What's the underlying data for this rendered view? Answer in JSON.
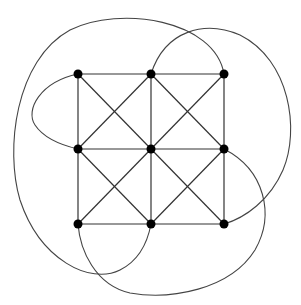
{
  "diagram": {
    "type": "graph",
    "nodes": [
      {
        "id": "n00",
        "x": 78,
        "y": 74
      },
      {
        "id": "n01",
        "x": 151,
        "y": 74
      },
      {
        "id": "n02",
        "x": 224,
        "y": 74
      },
      {
        "id": "n10",
        "x": 78,
        "y": 149
      },
      {
        "id": "n11",
        "x": 151,
        "y": 149
      },
      {
        "id": "n12",
        "x": 224,
        "y": 149
      },
      {
        "id": "n20",
        "x": 78,
        "y": 224
      },
      {
        "id": "n21",
        "x": 151,
        "y": 224
      },
      {
        "id": "n22",
        "x": 224,
        "y": 224
      }
    ],
    "straight_edges": [
      [
        "n00",
        "n01"
      ],
      [
        "n01",
        "n02"
      ],
      [
        "n10",
        "n11"
      ],
      [
        "n11",
        "n12"
      ],
      [
        "n20",
        "n21"
      ],
      [
        "n21",
        "n22"
      ],
      [
        "n00",
        "n10"
      ],
      [
        "n10",
        "n20"
      ],
      [
        "n01",
        "n11"
      ],
      [
        "n11",
        "n21"
      ],
      [
        "n02",
        "n12"
      ],
      [
        "n12",
        "n22"
      ],
      [
        "n00",
        "n11"
      ],
      [
        "n11",
        "n22"
      ],
      [
        "n01",
        "n10"
      ],
      [
        "n10",
        "n21"
      ],
      [
        "n01",
        "n12"
      ],
      [
        "n12",
        "n21"
      ],
      [
        "n02",
        "n11"
      ],
      [
        "n11",
        "n20"
      ]
    ],
    "curved_edges": [
      {
        "from": "n02",
        "to": "n21",
        "path": "M224,74 C215,20 120,5 70,30 C15,60 5,150 20,200 C40,260 90,285 120,270 C140,260 148,240 151,224"
      },
      {
        "from": "n00",
        "to": "n10",
        "path": "M78,74 C40,82 25,110 35,125 C45,140 65,146 78,149"
      },
      {
        "from": "n01",
        "to": "n22",
        "path": "M151,74 C165,30 205,20 240,35 C290,60 300,130 283,170 C270,200 245,218 224,224"
      },
      {
        "from": "n12",
        "to": "n20",
        "path": "M224,149 C265,170 275,215 255,250 C230,290 170,300 130,293 C95,285 80,250 78,224"
      }
    ]
  }
}
